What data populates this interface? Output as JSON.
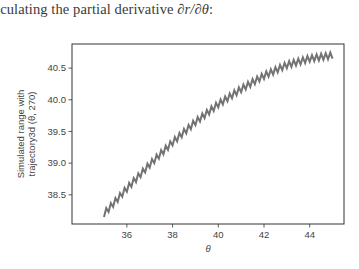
{
  "caption": {
    "prefix": "lculating the partial derivative ",
    "math": "∂r/∂θ",
    "suffix": ":"
  },
  "chart_data": {
    "type": "line",
    "title": "",
    "xlabel": "θ",
    "ylabel": "Simulated range with trajectory3d (θ, 270)",
    "ylabel_lines": [
      "Simulated range with",
      "trajectory3d (θ, 270)"
    ],
    "xlim": [
      33.6,
      45.5
    ],
    "ylim": [
      38.04,
      40.88
    ],
    "xticks": [
      36,
      38,
      40,
      42,
      44
    ],
    "xtick_labels": [
      "36",
      "38",
      "40",
      "42",
      "44"
    ],
    "yticks": [
      38.5,
      39.0,
      39.5,
      40.0,
      40.5
    ],
    "ytick_labels": [
      "38.5",
      "39.0",
      "39.5",
      "40.0",
      "40.5"
    ],
    "grid": false,
    "legend": null,
    "series": [
      {
        "name": "simulated range",
        "color": "#737373",
        "description": "smooth concave-down trend with small high-frequency sawtooth oscillation (~±0.05) superimposed",
        "x": [
          35.0,
          36.0,
          37.0,
          38.0,
          39.0,
          40.0,
          41.0,
          42.0,
          43.0,
          44.0,
          45.0
        ],
        "values": [
          38.2,
          38.6,
          38.98,
          39.33,
          39.65,
          39.93,
          40.17,
          40.38,
          40.55,
          40.65,
          40.7
        ],
        "oscillation_amplitude": 0.05,
        "oscillation_period": 0.2
      }
    ]
  }
}
